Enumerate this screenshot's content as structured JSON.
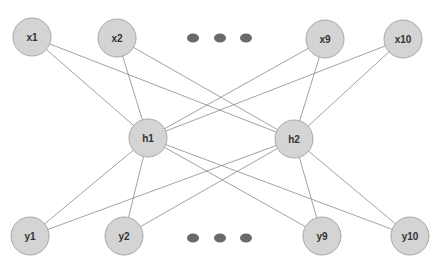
{
  "diagram": {
    "type": "neural-network",
    "colors": {
      "node_fill": "#d4d4d4",
      "node_stroke": "#a8a8a8",
      "edge": "#8a8a8a",
      "ellipsis": "#6a6a6a",
      "label": "#333333"
    },
    "node_radius": 19,
    "nodes": [
      {
        "id": "x1",
        "label": "x1",
        "layer": "input",
        "cx": 32,
        "cy": 37
      },
      {
        "id": "x2",
        "label": "x2",
        "layer": "input",
        "cx": 117,
        "cy": 38
      },
      {
        "id": "x9",
        "label": "x9",
        "layer": "input",
        "cx": 325,
        "cy": 39
      },
      {
        "id": "x10",
        "label": "x10",
        "layer": "input",
        "cx": 403,
        "cy": 39
      },
      {
        "id": "h1",
        "label": "h1",
        "layer": "hidden",
        "cx": 148,
        "cy": 138
      },
      {
        "id": "h2",
        "label": "h2",
        "layer": "hidden",
        "cx": 294,
        "cy": 139
      },
      {
        "id": "y1",
        "label": "y1",
        "layer": "output",
        "cx": 30,
        "cy": 236
      },
      {
        "id": "y2",
        "label": "y2",
        "layer": "output",
        "cx": 124,
        "cy": 236
      },
      {
        "id": "y9",
        "label": "y9",
        "layer": "output",
        "cx": 322,
        "cy": 236
      },
      {
        "id": "y10",
        "label": "y10",
        "layer": "output",
        "cx": 410,
        "cy": 236
      }
    ],
    "edges": [
      [
        "x1",
        "h1"
      ],
      [
        "x1",
        "h2"
      ],
      [
        "x2",
        "h1"
      ],
      [
        "x2",
        "h2"
      ],
      [
        "x9",
        "h1"
      ],
      [
        "x9",
        "h2"
      ],
      [
        "x10",
        "h1"
      ],
      [
        "x10",
        "h2"
      ],
      [
        "h1",
        "y1"
      ],
      [
        "h1",
        "y2"
      ],
      [
        "h1",
        "y9"
      ],
      [
        "h1",
        "y10"
      ],
      [
        "h2",
        "y1"
      ],
      [
        "h2",
        "y2"
      ],
      [
        "h2",
        "y9"
      ],
      [
        "h2",
        "y10"
      ]
    ],
    "ellipsis": [
      {
        "position": "top",
        "dots": [
          [
            193,
            38
          ],
          [
            220,
            38
          ],
          [
            246,
            38
          ]
        ]
      },
      {
        "position": "bottom",
        "dots": [
          [
            193,
            238
          ],
          [
            220,
            238
          ],
          [
            246,
            238
          ]
        ]
      }
    ]
  }
}
